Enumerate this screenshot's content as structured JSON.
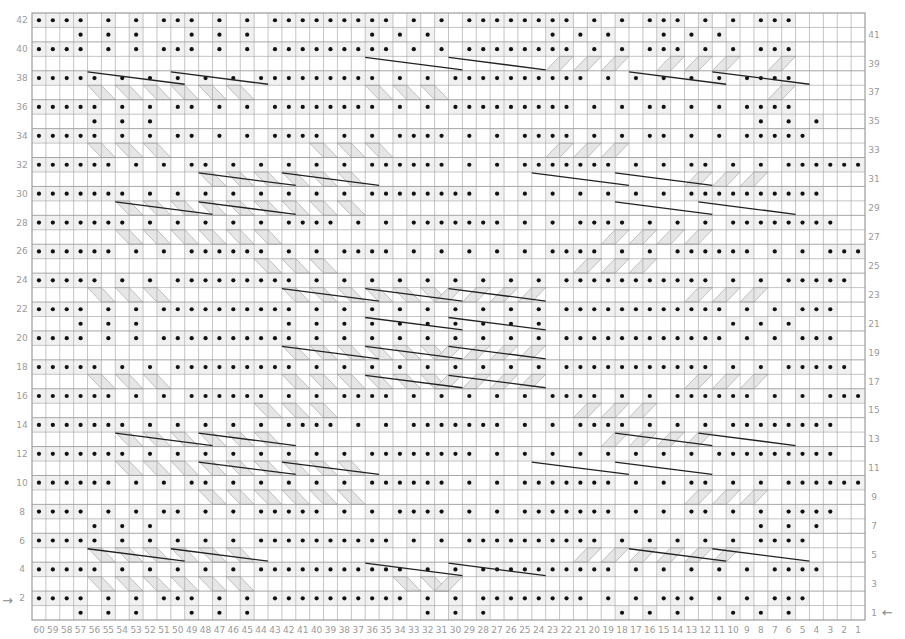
{
  "chart_data": {
    "type": "knitting-chart",
    "title": "",
    "columns": 60,
    "rows": 42,
    "column_labels_left_to_right": [
      "60",
      "59",
      "58",
      "57",
      "56",
      "55",
      "54",
      "53",
      "52",
      "51",
      "50",
      "49",
      "48",
      "47",
      "46",
      "45",
      "44",
      "43",
      "42",
      "41",
      "40",
      "39",
      "38",
      "37",
      "36",
      "35",
      "34",
      "33",
      "32",
      "31",
      "30",
      "29",
      "28",
      "27",
      "26",
      "25",
      "24",
      "23",
      "22",
      "21",
      "20",
      "19",
      "18",
      "17",
      "16",
      "15",
      "14",
      "13",
      "12",
      "11",
      "10",
      "9",
      "8",
      "7",
      "6",
      "5",
      "4",
      "3",
      "2",
      "1"
    ],
    "left_row_labels": [
      "42",
      "40",
      "38",
      "36",
      "34",
      "32",
      "30",
      "28",
      "26",
      "24",
      "22",
      "20",
      "18",
      "16",
      "14",
      "12",
      "10",
      "8",
      "6",
      "4",
      "2"
    ],
    "right_row_labels": [
      "41",
      "39",
      "37",
      "35",
      "33",
      "31",
      "29",
      "27",
      "25",
      "23",
      "21",
      "19",
      "17",
      "15",
      "13",
      "11",
      "9",
      "7",
      "5",
      "3",
      "1"
    ],
    "start_markers": {
      "row_2": "→",
      "row_1": "←"
    },
    "legend": {
      "dot": "purl stitch",
      "blank": "knit stitch",
      "diagonal band": "cable travel",
      "long bar": "cable cross"
    },
    "rows_top_to_bottom": [
      "oooo.o.o.ooo.o.o.ooooooooo.o.o.oooooooo.o.o.ooo.o.o.ooo....",
      "...o.o.o...o.o.o........o.o.o........o.o.o...o.o.o.........",
      "oooo.o.o.ooo.o.o.ooooooooo.o.o.oooooooo.o.o.ooo.o.o.ooo....",
      "............................................................",
      "ooooo.o.o.o.o.o.ooooooooo.o.o.oooooooooo.o.o.o.o.o.oooo.....",
      "............................................................",
      "ooooo.o.o.oo.o.o.oooooooo.o.o.ooooooooo.o.o.oo.o.o.oooo.....",
      "....o.o.o...........................................o.o.o...",
      "ooooo.o.o.oo.o.o.oooo.o.o.oooo.o.o.oooo.o.o.oo.o.o.ooooo....",
      "............................................................",
      "oooooo.o.o.oo.o.o.o.o.o.oooooo.o.o.ooooooo.o.o.oo.o.o.oooooo",
      "............................................................",
      "ooooooo.o.o.o.o.o.o.o.o.oooooooo.o.o.o.o.o.o.o.oooooooooo...",
      "............................................................",
      "ooooooo.o.o.o.o.o.oooo.o.o.ooooooo.o.o.oooo.o.o.o.oooooooo..",
      "............................................................",
      "oooooo.o.o.oooooo.o.o.oooo.o.o.o.o.o.oooo.o.o.oooooo.o.o.ooo",
      "............................................................",
      "ooooo.o.o.ooooooooo.o.o.o.o.o.o.o.o.o.ooooooooooo.o.o.ooooo.",
      "............................................................",
      "oooo.o.o.oooooooooo.o.o.o.o.o.o.o.o.o.oooooooooooo.o.o.ooo..",
      "...o.o.o..........o.o.o.o.o.o.o.o.o.o.............o.o.o.....",
      "oooo.o.o.oooooooooo.o.o.o.o.o.o.o.o.o.oooooooooooo.o.o.ooo..",
      "............................................................",
      "ooooo.o.o.ooooooooo.o.o.o.o.o.o.o.o.o.ooooooooooo.o.o.ooooo.",
      "............................................................",
      "oooooo.o.o.oooooo.o.o.oooo.o.o.o.o.o.oooo.o.o.oooooo.o.o.ooo",
      "............................................................",
      "ooooooo.o.o.o.o.o.oooo.o.o.ooooooo.o.o.oooo.o.o.o.oooooooo..",
      "............................................................",
      "ooooooo.o.o.o.o.o.o.o.o.oooooooo.o.o.o.o.o.o.o.o.ooooooooo..",
      "............................................................",
      "oooooo.o.o.oo.o.o.o.o.o.oooooo.o.o.ooooooo.o.o.oo.o.o.oooooo",
      "............................................................",
      "oooo.o.o.oo.o.o.ooooo.o.o.oooo.o.o.ooooooo.o.o.oo.o.o.oooo..",
      "....o.o.o...........................................o.o.o...",
      "ooooo.o.o.o.o.o.oooooooooo.o.o.oooooooooo.o.o.o.o.o.oooo....",
      "............................................................",
      "ooooo.o.o.o.o.o.ooooooooooo.o.o.oooooooooo.o.o.o.o.o.oooo...",
      "............................................................",
      "oooo.o.o.ooo.o.o.oooooooooo.o.o.oooooooo.o.o.ooo.o.o.ooo....",
      "...o.o.o...o.o.o............o.o.o.........o.o.o...o.o.o....."
    ],
    "cable_bars": [
      {
        "row": 38,
        "from_col": 56,
        "to_col": 50
      },
      {
        "row": 38,
        "from_col": 50,
        "to_col": 44
      },
      {
        "row": 39,
        "from_col": 36,
        "to_col": 30
      },
      {
        "row": 39,
        "from_col": 30,
        "to_col": 24
      },
      {
        "row": 38,
        "from_col": 17,
        "to_col": 11
      },
      {
        "row": 38,
        "from_col": 11,
        "to_col": 5
      },
      {
        "row": 31,
        "from_col": 48,
        "to_col": 42
      },
      {
        "row": 31,
        "from_col": 42,
        "to_col": 36
      },
      {
        "row": 29,
        "from_col": 54,
        "to_col": 48
      },
      {
        "row": 29,
        "from_col": 48,
        "to_col": 42
      },
      {
        "row": 31,
        "from_col": 24,
        "to_col": 18
      },
      {
        "row": 31,
        "from_col": 18,
        "to_col": 12
      },
      {
        "row": 29,
        "from_col": 18,
        "to_col": 12
      },
      {
        "row": 29,
        "from_col": 12,
        "to_col": 6
      },
      {
        "row": 23,
        "from_col": 42,
        "to_col": 36
      },
      {
        "row": 23,
        "from_col": 36,
        "to_col": 30
      },
      {
        "row": 23,
        "from_col": 30,
        "to_col": 24
      },
      {
        "row": 21,
        "from_col": 36,
        "to_col": 30
      },
      {
        "row": 21,
        "from_col": 30,
        "to_col": 24
      },
      {
        "row": 19,
        "from_col": 42,
        "to_col": 36
      },
      {
        "row": 19,
        "from_col": 36,
        "to_col": 30
      },
      {
        "row": 19,
        "from_col": 30,
        "to_col": 24
      },
      {
        "row": 17,
        "from_col": 36,
        "to_col": 30
      },
      {
        "row": 17,
        "from_col": 30,
        "to_col": 24
      },
      {
        "row": 13,
        "from_col": 54,
        "to_col": 48
      },
      {
        "row": 13,
        "from_col": 48,
        "to_col": 42
      },
      {
        "row": 11,
        "from_col": 48,
        "to_col": 42
      },
      {
        "row": 11,
        "from_col": 42,
        "to_col": 36
      },
      {
        "row": 13,
        "from_col": 18,
        "to_col": 12
      },
      {
        "row": 13,
        "from_col": 12,
        "to_col": 6
      },
      {
        "row": 11,
        "from_col": 24,
        "to_col": 18
      },
      {
        "row": 11,
        "from_col": 18,
        "to_col": 12
      },
      {
        "row": 5,
        "from_col": 56,
        "to_col": 50
      },
      {
        "row": 5,
        "from_col": 50,
        "to_col": 44
      },
      {
        "row": 4,
        "from_col": 36,
        "to_col": 30
      },
      {
        "row": 4,
        "from_col": 30,
        "to_col": 24
      },
      {
        "row": 5,
        "from_col": 17,
        "to_col": 11
      },
      {
        "row": 5,
        "from_col": 11,
        "to_col": 5
      }
    ],
    "colors": {
      "grid": "#9c9c9c",
      "dot": "#111111",
      "band": "#e6e6e6",
      "bar": "#222222",
      "labels": "#9a9a9a"
    }
  }
}
